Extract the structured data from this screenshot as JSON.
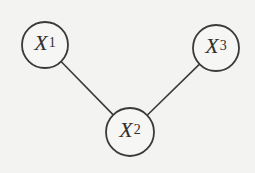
{
  "diagram": {
    "type": "undirected-graph",
    "background": "#f3f3f1",
    "stroke_color": "#3a3a3a",
    "node_fill": "#f6f6f4",
    "nodes": [
      {
        "id": "X1",
        "variable": "X",
        "subscript": "1",
        "cx": 45,
        "cy": 45,
        "r": 23
      },
      {
        "id": "X2",
        "variable": "X",
        "subscript": "2",
        "cx": 130,
        "cy": 132,
        "r": 24
      },
      {
        "id": "X3",
        "variable": "X",
        "subscript": "3",
        "cx": 216,
        "cy": 48,
        "r": 23
      }
    ],
    "edges": [
      {
        "from": "X1",
        "to": "X2"
      },
      {
        "from": "X2",
        "to": "X3"
      }
    ]
  }
}
